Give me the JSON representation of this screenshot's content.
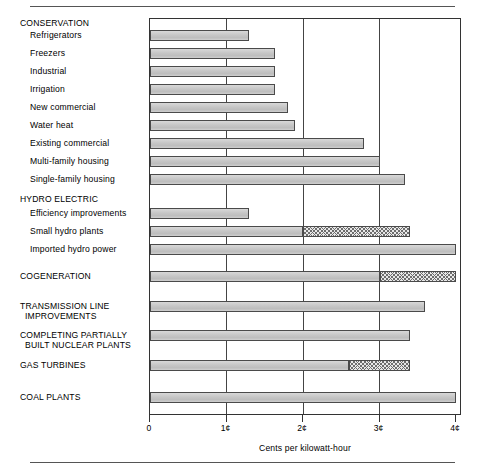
{
  "chart_data": {
    "type": "bar",
    "orientation": "horizontal",
    "title": "",
    "xlabel": "Cents per kilowatt-hour",
    "ylabel": "",
    "xlim": [
      0,
      4
    ],
    "xticks": [
      0,
      1,
      2,
      3,
      4
    ],
    "xtick_labels": [
      "0",
      "1¢",
      "2¢",
      "3¢",
      "4¢"
    ],
    "grid": true,
    "legend": null,
    "note": "Bars drawn with two segments: a solid grey portion and a cross-hatched portion representing the upper part of a cost range.",
    "groups": [
      {
        "name": "CONSERVATION",
        "categories": [
          "Refrigerators",
          "Freezers",
          "Industrial",
          "Irrigation",
          "New commercial",
          "Water heat",
          "Existing commercial",
          "Multi-family housing",
          "Single-family housing"
        ],
        "values": [
          1.3,
          1.63,
          1.63,
          1.63,
          1.8,
          1.9,
          2.8,
          3.0,
          3.33
        ],
        "hatched_from": [
          null,
          null,
          null,
          null,
          null,
          null,
          null,
          null,
          null
        ]
      },
      {
        "name": "HYDRO ELECTRIC",
        "categories": [
          "Efficiency improvements",
          "Small hydro plants",
          "Imported hydro power"
        ],
        "values": [
          1.3,
          3.4,
          4.0
        ],
        "hatched_from": [
          null,
          2.0,
          null
        ]
      },
      {
        "name": "COGENERATION",
        "categories": [
          "COGENERATION"
        ],
        "values": [
          4.0
        ],
        "hatched_from": [
          3.0
        ]
      },
      {
        "name": "TRANSMISSION LINE IMPROVEMENTS",
        "categories": [
          "TRANSMISSION LINE\nIMPROVEMENTS"
        ],
        "values": [
          3.6
        ],
        "hatched_from": [
          null
        ]
      },
      {
        "name": "COMPLETING PARTIALLY BUILT NUCLEAR PLANTS",
        "categories": [
          "COMPLETING PARTIALLY\n  BUILT NUCLEAR PLANTS"
        ],
        "values": [
          3.4
        ],
        "hatched_from": [
          null
        ]
      },
      {
        "name": "GAS TURBINES",
        "categories": [
          "GAS TURBINES"
        ],
        "values": [
          3.4
        ],
        "hatched_from": [
          2.6
        ]
      },
      {
        "name": "COAL PLANTS",
        "categories": [
          "COAL PLANTS"
        ],
        "values": [
          4.0
        ],
        "hatched_from": [
          null
        ]
      }
    ],
    "rows": [
      {
        "label": "CONSERVATION",
        "kind": "heading",
        "indent": 0,
        "value": null,
        "hatched_from": null,
        "y": 22
      },
      {
        "label": "Refrigerators",
        "kind": "bar",
        "indent": 1,
        "value": 1.3,
        "hatched_from": null,
        "y": 34
      },
      {
        "label": "Freezers",
        "kind": "bar",
        "indent": 1,
        "value": 1.63,
        "hatched_from": null,
        "y": 52
      },
      {
        "label": "Industrial",
        "kind": "bar",
        "indent": 1,
        "value": 1.63,
        "hatched_from": null,
        "y": 70
      },
      {
        "label": "Irrigation",
        "kind": "bar",
        "indent": 1,
        "value": 1.63,
        "hatched_from": null,
        "y": 88
      },
      {
        "label": "New commercial",
        "kind": "bar",
        "indent": 1,
        "value": 1.8,
        "hatched_from": null,
        "y": 106
      },
      {
        "label": "Water heat",
        "kind": "bar",
        "indent": 1,
        "value": 1.9,
        "hatched_from": null,
        "y": 124
      },
      {
        "label": "Existing commercial",
        "kind": "bar",
        "indent": 1,
        "value": 2.8,
        "hatched_from": null,
        "y": 142
      },
      {
        "label": "Multi-family housing",
        "kind": "bar",
        "indent": 1,
        "value": 3.0,
        "hatched_from": null,
        "y": 160
      },
      {
        "label": "Single-family housing",
        "kind": "bar",
        "indent": 1,
        "value": 3.33,
        "hatched_from": null,
        "y": 178
      },
      {
        "label": "HYDRO ELECTRIC",
        "kind": "heading",
        "indent": 0,
        "value": null,
        "hatched_from": null,
        "y": 198
      },
      {
        "label": "Efficiency improvements",
        "kind": "bar",
        "indent": 1,
        "value": 1.3,
        "hatched_from": null,
        "y": 212
      },
      {
        "label": "Small hydro plants",
        "kind": "bar",
        "indent": 1,
        "value": 3.4,
        "hatched_from": 2.0,
        "y": 230
      },
      {
        "label": "Imported hydro power",
        "kind": "bar",
        "indent": 1,
        "value": 4.0,
        "hatched_from": null,
        "y": 248
      },
      {
        "label": "COGENERATION",
        "kind": "bar-heading",
        "indent": 0,
        "value": 4.0,
        "hatched_from": 3.0,
        "y": 275
      },
      {
        "label": "TRANSMISSION LINE\n  IMPROVEMENTS",
        "kind": "bar-heading",
        "indent": 0,
        "value": 3.6,
        "hatched_from": null,
        "y": 305
      },
      {
        "label": "COMPLETING PARTIALLY\n  BUILT NUCLEAR PLANTS",
        "kind": "bar-heading",
        "indent": 0,
        "value": 3.4,
        "hatched_from": null,
        "y": 334
      },
      {
        "label": "GAS TURBINES",
        "kind": "bar-heading",
        "indent": 0,
        "value": 3.4,
        "hatched_from": 2.6,
        "y": 364
      },
      {
        "label": "COAL PLANTS",
        "kind": "bar-heading",
        "indent": 0,
        "value": 4.0,
        "hatched_from": null,
        "y": 396
      }
    ]
  }
}
